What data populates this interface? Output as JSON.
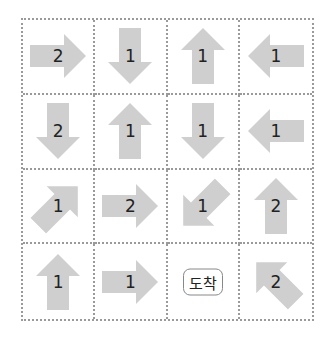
{
  "colors": {
    "arrow": "#cfcfcf",
    "grid_line": "#9a9a9a",
    "text": "#222222"
  },
  "grid": {
    "rows": [
      [
        {
          "dir": "right",
          "steps": "2"
        },
        {
          "dir": "down",
          "steps": "1"
        },
        {
          "dir": "up",
          "steps": "1"
        },
        {
          "dir": "left",
          "steps": "1"
        }
      ],
      [
        {
          "dir": "down",
          "steps": "2"
        },
        {
          "dir": "up",
          "steps": "1"
        },
        {
          "dir": "down",
          "steps": "1"
        },
        {
          "dir": "left",
          "steps": "1"
        }
      ],
      [
        {
          "dir": "up-right",
          "steps": "1"
        },
        {
          "dir": "right",
          "steps": "2"
        },
        {
          "dir": "down-left",
          "steps": "1"
        },
        {
          "dir": "up",
          "steps": "2"
        }
      ],
      [
        {
          "dir": "up",
          "steps": "1"
        },
        {
          "dir": "right",
          "steps": "1"
        },
        {
          "goal": "도착"
        },
        {
          "dir": "up-left",
          "steps": "2"
        }
      ]
    ]
  }
}
